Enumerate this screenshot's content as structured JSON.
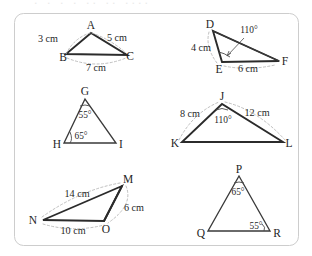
{
  "page": {
    "background_color": "#ffffff",
    "frame_color": "#cdcdcd",
    "line_color": "#3a3a3a",
    "dash_color": "#b4b4b4",
    "top_cut_text": ". . . . .. .. ...."
  },
  "figures": [
    {
      "id": "triangle-abc",
      "name": "triangle-abc",
      "vertices": [
        {
          "label": "A",
          "x": 91,
          "y": 29
        },
        {
          "label": "B",
          "x": 63,
          "y": 57
        },
        {
          "label": "C",
          "x": 129,
          "y": 57
        }
      ],
      "side_labels": [
        {
          "text": "3 cm",
          "x": 48,
          "y": 41
        },
        {
          "text": "5 cm",
          "x": 116,
          "y": 40
        },
        {
          "text": "7 cm",
          "x": 95,
          "y": 68
        }
      ],
      "angle_labels": []
    },
    {
      "id": "triangle-def",
      "name": "triangle-def",
      "vertices": [
        {
          "label": "D",
          "x": 211,
          "y": 27
        },
        {
          "label": "E",
          "x": 221,
          "y": 66
        },
        {
          "label": "F",
          "x": 282,
          "y": 62
        }
      ],
      "side_labels": [
        {
          "text": "4 cm",
          "x": 203,
          "y": 48
        },
        {
          "text": "6 cm",
          "x": 248,
          "y": 70
        }
      ],
      "angle_labels": [
        {
          "text": "110°",
          "x": 248,
          "y": 31,
          "at_vertex": "E"
        }
      ]
    },
    {
      "id": "triangle-ghi",
      "name": "triangle-ghi",
      "vertices": [
        {
          "label": "G",
          "x": 84,
          "y": 93
        },
        {
          "label": "H",
          "x": 62,
          "y": 146
        },
        {
          "label": "I",
          "x": 117,
          "y": 146
        }
      ],
      "side_labels": [],
      "angle_labels": [
        {
          "text": "55°",
          "x": 84,
          "y": 113,
          "at_vertex": "G"
        },
        {
          "text": "65°",
          "x": 79,
          "y": 139,
          "at_vertex": "H"
        }
      ]
    },
    {
      "id": "triangle-jkl",
      "name": "triangle-jkl",
      "vertices": [
        {
          "label": "J",
          "x": 222,
          "y": 98
        },
        {
          "label": "K",
          "x": 179,
          "y": 143
        },
        {
          "label": "L",
          "x": 285,
          "y": 143
        }
      ],
      "side_labels": [
        {
          "text": "8 cm",
          "x": 186,
          "y": 114
        },
        {
          "text": "12 cm",
          "x": 257,
          "y": 113
        }
      ],
      "angle_labels": [
        {
          "text": "110°",
          "x": 224,
          "y": 120,
          "at_vertex": "J"
        }
      ]
    },
    {
      "id": "triangle-mno",
      "name": "triangle-mno",
      "vertices": [
        {
          "label": "M",
          "x": 124,
          "y": 182
        },
        {
          "label": "N",
          "x": 38,
          "y": 220
        },
        {
          "label": "O",
          "x": 106,
          "y": 224
        }
      ],
      "side_labels": [
        {
          "text": "14 cm",
          "x": 77,
          "y": 194
        },
        {
          "text": "6 cm",
          "x": 131,
          "y": 208
        },
        {
          "text": "10 cm",
          "x": 73,
          "y": 232
        }
      ],
      "angle_labels": []
    },
    {
      "id": "triangle-pqr",
      "name": "triangle-pqr",
      "vertices": [
        {
          "label": "P",
          "x": 239,
          "y": 170
        },
        {
          "label": "Q",
          "x": 206,
          "y": 234
        },
        {
          "label": "R",
          "x": 272,
          "y": 234
        }
      ],
      "side_labels": [],
      "angle_labels": [
        {
          "text": "65°",
          "x": 238,
          "y": 192,
          "at_vertex": "P"
        },
        {
          "text": "55°",
          "x": 257,
          "y": 226,
          "at_vertex": "R"
        }
      ]
    }
  ]
}
